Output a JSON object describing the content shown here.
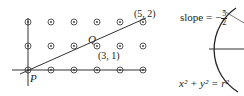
{
  "left_figure": {
    "grid": {
      "columns": 6,
      "rows": 3,
      "x_pixels": [
        28,
        51,
        74,
        97,
        120,
        143
      ],
      "y_pixels": [
        22,
        46,
        70
      ]
    },
    "labels": {
      "p": "P",
      "q": "Q",
      "point_31": "(3, 1)",
      "point_52": "(5, 2)"
    }
  },
  "right_figure": {
    "slope_prefix": "slope = −",
    "slope_num": "5",
    "slope_den": "2",
    "equation": "x² + y² = r²"
  }
}
